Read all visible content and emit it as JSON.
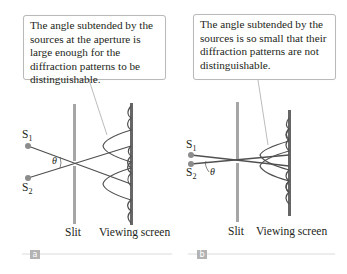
{
  "panels": [
    {
      "id": "a",
      "tag": "a",
      "callout": "The angle subtended by the sources at the aperture is large enough for the diffraction patterns to be distinguishable.",
      "source1": "S",
      "source1_sub": "1",
      "source2": "S",
      "source2_sub": "2",
      "angle": "θ",
      "slit_label": "Slit",
      "screen_label": "Viewing screen"
    },
    {
      "id": "b",
      "tag": "b",
      "callout": "The angle subtended by the sources is so small that their diffraction patterns are not distinguishable.",
      "source1": "S",
      "source1_sub": "1",
      "source2": "S",
      "source2_sub": "2",
      "angle": "θ",
      "slit_label": "Slit",
      "screen_label": "Viewing screen"
    }
  ],
  "colors": {
    "ray": "#505050",
    "slit": "#a0a0a0",
    "screen": "#6a6a6a",
    "source_dot": "#8c8c8c",
    "callout_border": "#b9b9b9",
    "tag_bg": "#b3b3b3"
  }
}
